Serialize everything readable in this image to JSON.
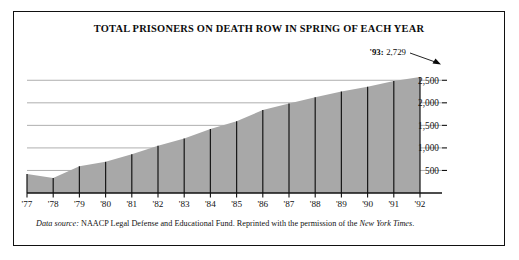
{
  "figure": {
    "title": "TOTAL PRISONERS ON DEATH ROW IN SPRING OF EACH YEAR",
    "source_prefix": "Data source:",
    "source_body": "NAACP Legal Defense and Educational Fund. Reprinted with the permission of the",
    "source_italic_tail": "New York Times",
    "source_end": ".",
    "annotation_label": "'93:",
    "annotation_value": "2,729",
    "border_color": "#111111",
    "area_fill": "#a8a8a8",
    "gridline_color": "#9a9a9a",
    "axis_color": "#111111"
  },
  "chart_data": {
    "type": "area",
    "title": "TOTAL PRISONERS ON DEATH ROW IN SPRING OF EACH YEAR",
    "xlabel": "",
    "ylabel": "",
    "grid": true,
    "legend": "none",
    "ylim": [
      0,
      2750
    ],
    "yticks": [
      500,
      1000,
      1500,
      2000,
      2500
    ],
    "ytick_labels": [
      "500",
      "1,000",
      "1,500",
      "2,000",
      "2,500"
    ],
    "categories": [
      "'77",
      "'78",
      "'79",
      "'80",
      "'81",
      "'82",
      "'83",
      "'84",
      "'85",
      "'86",
      "'87",
      "'88",
      "'89",
      "'90",
      "'91",
      "'92"
    ],
    "x": [
      1977,
      1978,
      1979,
      1980,
      1981,
      1982,
      1983,
      1984,
      1985,
      1986,
      1987,
      1988,
      1989,
      1990,
      1991,
      1992
    ],
    "values": [
      423,
      334,
      593,
      691,
      860,
      1050,
      1209,
      1420,
      1591,
      1838,
      1984,
      2124,
      2250,
      2356,
      2482,
      2575
    ],
    "annotations": [
      {
        "text": "'93: 2,729",
        "x": 1993,
        "y": 2729,
        "arrow": true
      }
    ],
    "series": [
      {
        "name": "Total prisoners on death row",
        "values": [
          423,
          334,
          593,
          691,
          860,
          1050,
          1209,
          1420,
          1591,
          1838,
          1984,
          2124,
          2250,
          2356,
          2482,
          2575
        ]
      }
    ]
  }
}
